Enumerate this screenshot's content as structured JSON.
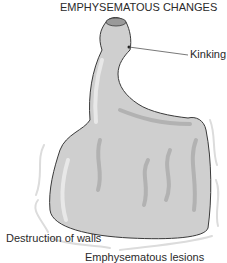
{
  "figure": {
    "title": "EMPHYSEMATOUS CHANGES",
    "labels": {
      "kinking": "Kinking",
      "destruction": "Destruction of walls",
      "lesions": "Emphysematous lesions"
    },
    "colors": {
      "fill": "#cfcfcf",
      "shade": "#b4b4b4",
      "highlight": "#e6e6e6",
      "outline": "#3a3a3a",
      "halo": "#dcdcdc",
      "leader": "#555555"
    }
  }
}
